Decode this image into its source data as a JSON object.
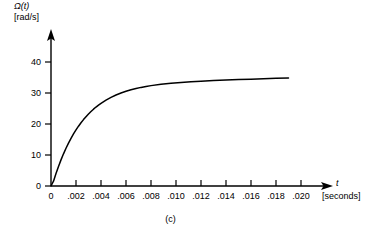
{
  "figure": {
    "caption": "(c)",
    "background_color": "#ffffff",
    "line_color": "#000000"
  },
  "yaxis": {
    "label_line1": "Ω(t)",
    "label_line2": "[rad/s]",
    "ticks": [
      0,
      10,
      20,
      30,
      40
    ],
    "tick_labels": [
      "0",
      "10",
      "20",
      "30",
      "40"
    ]
  },
  "xaxis": {
    "variable": "t",
    "unit": "[seconds]",
    "ticks": [
      0.002,
      0.004,
      0.006,
      0.008,
      0.01,
      0.012,
      0.014,
      0.016,
      0.018,
      0.02
    ],
    "tick_labels": [
      ".002",
      ".004",
      ".006",
      ".008",
      ".010",
      ".012",
      ".014",
      ".016",
      ".018",
      ".020"
    ],
    "origin_label": "0"
  },
  "chart_data": {
    "type": "line",
    "title": "",
    "subtitle": "",
    "caption": "(c)",
    "xlabel": "t [seconds]",
    "ylabel": "Ω(t) [rad/s]",
    "xlim": [
      0,
      0.0205
    ],
    "ylim": [
      0,
      44
    ],
    "grid": false,
    "legend": null,
    "series": [
      {
        "name": "Ω(t)",
        "color": "#000000",
        "description": "First-order step response rising from 0 to steady-state 39.4 rad/s with time constant approximately 0.0025 s",
        "steady_state": 39.4,
        "time_constant": 0.0025,
        "x": [
          0.0,
          0.0002,
          0.0004,
          0.0006,
          0.0008,
          0.001,
          0.0012,
          0.0014,
          0.0016,
          0.0018,
          0.002,
          0.0022,
          0.0024,
          0.0026,
          0.0028,
          0.003,
          0.0032,
          0.0034,
          0.0036,
          0.0038,
          0.004,
          0.0044,
          0.0048,
          0.0052,
          0.0056,
          0.006,
          0.0064,
          0.0068,
          0.0072,
          0.0076,
          0.008,
          0.0088,
          0.0096,
          0.0104,
          0.0112,
          0.012,
          0.013,
          0.014,
          0.015,
          0.016,
          0.017,
          0.018,
          0.019
        ],
        "y": [
          0.0,
          1.55,
          4.03,
          6.32,
          8.43,
          10.38,
          12.18,
          13.84,
          15.37,
          16.79,
          18.09,
          19.29,
          20.4,
          21.42,
          22.37,
          23.24,
          24.04,
          24.78,
          25.47,
          26.1,
          26.68,
          27.71,
          28.6,
          29.36,
          30.0,
          30.56,
          31.04,
          31.45,
          31.81,
          32.11,
          32.38,
          32.81,
          33.14,
          33.4,
          33.62,
          33.8,
          34.0,
          34.18,
          34.33,
          34.47,
          34.6,
          34.72,
          34.83
        ]
      }
    ]
  }
}
